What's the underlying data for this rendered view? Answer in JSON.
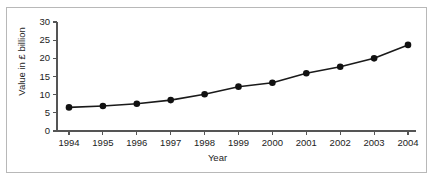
{
  "chart_data": {
    "type": "line",
    "title": "",
    "xlabel": "Year",
    "ylabel": "Value in £ billion",
    "categories": [
      "1994",
      "1995",
      "1996",
      "1997",
      "1998",
      "1999",
      "2000",
      "2001",
      "2002",
      "2003",
      "2004"
    ],
    "x": [
      1994,
      1995,
      1996,
      1997,
      1998,
      1999,
      2000,
      2001,
      2002,
      2003,
      2004
    ],
    "values": [
      6.5,
      6.9,
      7.5,
      8.5,
      10.1,
      12.2,
      13.3,
      15.9,
      17.7,
      20.0,
      23.7
    ],
    "series": [
      {
        "name": "Value in £ billion",
        "values": [
          6.5,
          6.9,
          7.5,
          8.5,
          10.1,
          12.2,
          13.3,
          15.9,
          17.7,
          20.0,
          23.7
        ]
      }
    ],
    "ylim": [
      0,
      30
    ],
    "yticks": [
      0,
      5,
      10,
      15,
      20,
      25,
      30
    ],
    "ytick_labels": [
      "0",
      "5",
      "10",
      "15",
      "20",
      "25",
      "30"
    ],
    "xtick_labels": [
      "1994",
      "1995",
      "1996",
      "1997",
      "1998",
      "1999",
      "2000",
      "2001",
      "2002",
      "2003",
      "2004"
    ],
    "grid": false,
    "legend": false,
    "legend_position": "none",
    "marker": "filled-circle",
    "line_color": "#1a1a1a",
    "marker_color": "#111111",
    "axis_color": "#555555",
    "background_color": "#ffffff",
    "frame_color": "#b8b8b8",
    "annotations": []
  }
}
